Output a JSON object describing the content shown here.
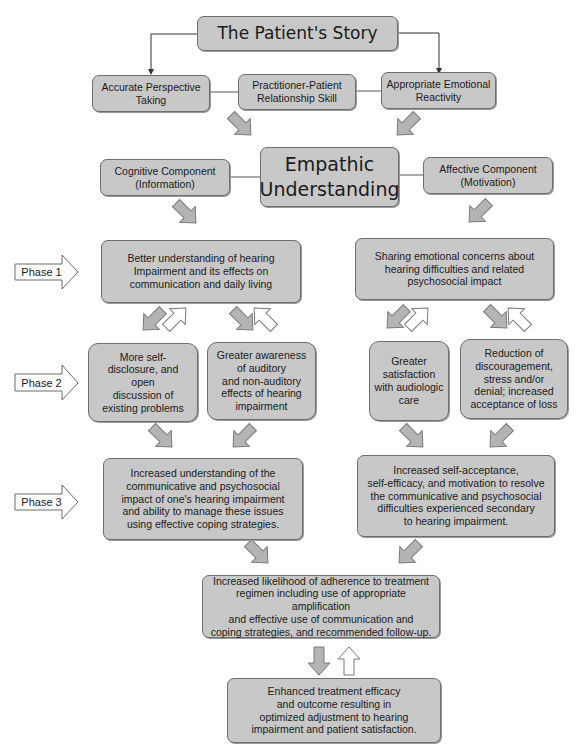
{
  "diagram": {
    "top": {
      "title": "The Patient's Story"
    },
    "skills": [
      {
        "label": "Accurate Perspective\nTaking"
      },
      {
        "label": "Practitioner-Patient\nRelationship Skill"
      },
      {
        "label": "Appropriate Emotional\nReactivity"
      }
    ],
    "center": {
      "title": "Empathic\nUnderstanding"
    },
    "components": [
      {
        "label": "Cognitive Component\n(Information)"
      },
      {
        "label": "Affective Component\n(Motivation)"
      }
    ],
    "phases": [
      {
        "label": "Phase 1"
      },
      {
        "label": "Phase 2"
      },
      {
        "label": "Phase 3"
      }
    ],
    "phase1": {
      "left": "Better understanding of hearing\nImpairment and its effects on\ncommunication and daily living",
      "right": "Sharing emotional concerns about\nhearing difficulties and related\npsychosocial impact"
    },
    "phase2": {
      "items": [
        "More self-\ndisclosure, and\nopen\ndiscussion of\nexisting problems",
        "Greater awareness\nof auditory\nand non-auditory\neffects of hearing\nimpairment",
        "Greater\nsatisfaction\nwith audiologic\ncare",
        "Reduction of\ndiscouragement,\nstress and/or\ndenial; increased\nacceptance of loss"
      ]
    },
    "phase3": {
      "left": "Increased understanding of the\ncommunicative and psychosocial\nimpact of one's hearing impairment\nand ability to manage these issues\nusing effective coping strategies.",
      "right": "Increased self-acceptance,\nself-efficacy, and motivation to resolve\nthe communicative and psychosocial\ndifficulties experienced secondary\nto hearing impairment."
    },
    "adherence": "Increased likelihood of adherence to treatment\nregimen including use of appropriate amplification\nand effective use of communication and\ncoping strategies, and recommended follow-up.",
    "outcome": "Enhanced treatment efficacy\nand outcome resulting in\noptimized adjustment to hearing\nimpairment and patient satisfaction.",
    "colors": {
      "box_fill": "#c8c8c8",
      "box_border": "#6e6e6e",
      "arrow_fill": "#b4b4b4",
      "hollow_arrow_fill": "#ffffff"
    }
  }
}
